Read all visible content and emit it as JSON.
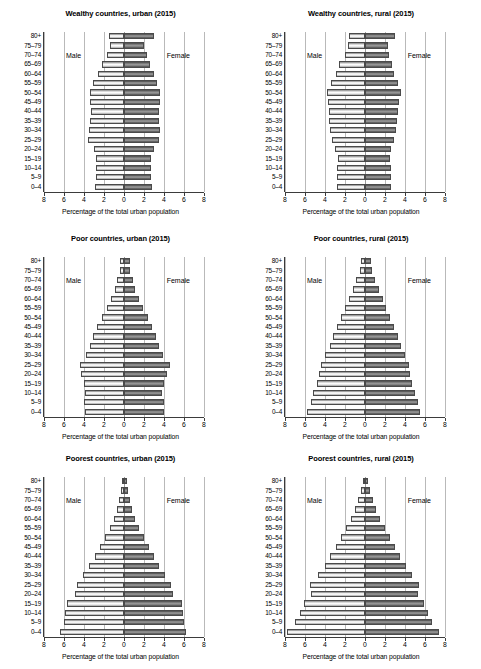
{
  "figure": {
    "age_groups": [
      "80+",
      "75–79",
      "70–74",
      "65–69",
      "60–64",
      "55–59",
      "50–54",
      "45–49",
      "40–44",
      "35–39",
      "30–34",
      "25–29",
      "20–24",
      "15–19",
      "10–14",
      "5–9",
      "0–4"
    ],
    "x_ticks": [
      "8",
      "6",
      "4",
      "2",
      "0",
      "2",
      "4",
      "6",
      "8"
    ],
    "x_axis_title": "Percentage of the total urban population",
    "male_label": "Male",
    "female_label": "Female",
    "male_color": "#f0f0f0",
    "female_color": "#7a7a7a",
    "axis_color": "#3b3b3b",
    "grid_color": "#b9b9b9",
    "xlim": [
      -8,
      8
    ]
  },
  "chart_data": [
    {
      "type": "bar",
      "title": "Wealthy countries, urban (2015)",
      "xlabel": "Percentage of the total urban population",
      "ylabel": "",
      "xlim": [
        -8,
        8
      ],
      "grid": true,
      "legend": [
        "Male",
        "Female"
      ],
      "annotations": [
        "Male",
        "Female"
      ],
      "categories": [
        "80+",
        "75–79",
        "70–74",
        "65–69",
        "60–64",
        "55–59",
        "50–54",
        "45–49",
        "40–44",
        "35–39",
        "30–34",
        "25–29",
        "20–24",
        "15–19",
        "10–14",
        "5–9",
        "0–4"
      ],
      "series": [
        {
          "name": "Male",
          "values": [
            1.55,
            1.45,
            1.75,
            2.2,
            2.65,
            3.1,
            3.45,
            3.45,
            3.35,
            3.4,
            3.55,
            3.6,
            3.05,
            2.85,
            2.85,
            2.8,
            2.95
          ]
        },
        {
          "name": "Female",
          "values": [
            3.0,
            1.95,
            2.25,
            2.6,
            2.95,
            3.3,
            3.6,
            3.55,
            3.45,
            3.45,
            3.55,
            3.5,
            2.95,
            2.7,
            2.7,
            2.7,
            2.8
          ]
        }
      ]
    },
    {
      "type": "bar",
      "title": "Wealthy countries, rural (2015)",
      "xlabel": "Percentage of the total urban population",
      "ylabel": "",
      "xlim": [
        -8,
        8
      ],
      "grid": true,
      "legend": [
        "Male",
        "Female"
      ],
      "annotations": [
        "Male",
        "Female"
      ],
      "categories": [
        "80+",
        "75–79",
        "70–74",
        "65–69",
        "60–64",
        "55–59",
        "50–54",
        "45–49",
        "40–44",
        "35–39",
        "30–34",
        "25–29",
        "20–24",
        "15–19",
        "10–14",
        "5–9",
        "0–4"
      ],
      "series": [
        {
          "name": "Male",
          "values": [
            1.6,
            1.7,
            2.05,
            2.6,
            2.95,
            3.4,
            3.85,
            3.75,
            3.65,
            3.6,
            3.5,
            3.3,
            3.0,
            2.75,
            2.85,
            2.85,
            2.8
          ]
        },
        {
          "name": "Female",
          "values": [
            2.95,
            2.3,
            2.35,
            2.65,
            2.9,
            3.25,
            3.55,
            3.4,
            3.3,
            3.2,
            3.1,
            2.9,
            2.6,
            2.45,
            2.6,
            2.6,
            2.55
          ]
        }
      ]
    },
    {
      "type": "bar",
      "title": "Poor countries, urban (2015)",
      "xlabel": "Percentage of the total urban population",
      "ylabel": "",
      "xlim": [
        -8,
        8
      ],
      "grid": true,
      "legend": [
        "Male",
        "Female"
      ],
      "annotations": [
        "Male",
        "Female"
      ],
      "categories": [
        "80+",
        "75–79",
        "70–74",
        "65–69",
        "60–64",
        "55–59",
        "50–54",
        "45–49",
        "40–44",
        "35–39",
        "30–34",
        "25–29",
        "20–24",
        "15–19",
        "10–14",
        "5–9",
        "0–4"
      ],
      "series": [
        {
          "name": "Male",
          "values": [
            0.4,
            0.45,
            0.7,
            0.95,
            1.3,
            1.7,
            2.2,
            2.7,
            3.1,
            3.4,
            3.8,
            4.45,
            4.35,
            4.0,
            3.9,
            4.0,
            3.95
          ]
        },
        {
          "name": "Female",
          "values": [
            0.55,
            0.6,
            0.85,
            1.1,
            1.45,
            1.85,
            2.35,
            2.8,
            3.2,
            3.5,
            3.9,
            4.55,
            4.25,
            3.95,
            3.8,
            3.95,
            3.95
          ]
        }
      ]
    },
    {
      "type": "bar",
      "title": "Poor countries, rural (2015)",
      "xlabel": "Percentage of the total urban population",
      "ylabel": "",
      "xlim": [
        -8,
        8
      ],
      "grid": true,
      "legend": [
        "Male",
        "Female"
      ],
      "annotations": [
        "Male",
        "Female"
      ],
      "categories": [
        "80+",
        "75–79",
        "70–74",
        "65–69",
        "60–64",
        "55–59",
        "50–54",
        "45–49",
        "40–44",
        "35–39",
        "30–34",
        "25–29",
        "20–24",
        "15–19",
        "10–14",
        "5–9",
        "0–4"
      ],
      "series": [
        {
          "name": "Male",
          "values": [
            0.45,
            0.55,
            0.9,
            1.25,
            1.65,
            2.05,
            2.45,
            2.85,
            3.2,
            3.55,
            4.0,
            4.45,
            4.6,
            4.85,
            5.25,
            5.45,
            5.8
          ]
        },
        {
          "name": "Female",
          "values": [
            0.6,
            0.7,
            1.0,
            1.35,
            1.75,
            2.1,
            2.5,
            2.9,
            3.25,
            3.55,
            3.95,
            4.35,
            4.45,
            4.65,
            5.0,
            5.25,
            5.45
          ]
        }
      ]
    },
    {
      "type": "bar",
      "title": "Poorest countries, urban (2015)",
      "xlabel": "Percentage of the total urban population",
      "ylabel": "",
      "xlim": [
        -8,
        8
      ],
      "grid": true,
      "legend": [
        "Male",
        "Female"
      ],
      "annotations": [
        "Male",
        "Female"
      ],
      "categories": [
        "80+",
        "75–79",
        "70–74",
        "65–69",
        "60–64",
        "55–59",
        "50–54",
        "45–49",
        "40–44",
        "35–39",
        "30–34",
        "25–29",
        "20–24",
        "15–19",
        "10–14",
        "5–9",
        "0–4"
      ],
      "series": [
        {
          "name": "Male",
          "values": [
            0.2,
            0.3,
            0.5,
            0.75,
            1.05,
            1.45,
            1.95,
            2.45,
            2.95,
            3.5,
            4.1,
            4.7,
            4.95,
            5.7,
            5.95,
            6.05,
            6.45
          ]
        },
        {
          "name": "Female",
          "values": [
            0.25,
            0.35,
            0.55,
            0.8,
            1.1,
            1.5,
            2.0,
            2.5,
            2.95,
            3.45,
            4.1,
            4.7,
            4.85,
            5.75,
            5.9,
            5.95,
            6.2
          ]
        }
      ]
    },
    {
      "type": "bar",
      "title": "Poorest countries, rural (2015)",
      "xlabel": "Percentage of the total urban population",
      "ylabel": "",
      "xlim": [
        -8,
        8
      ],
      "grid": true,
      "legend": [
        "Male",
        "Female"
      ],
      "annotations": [
        "Male",
        "Female"
      ],
      "categories": [
        "80+",
        "75–79",
        "70–74",
        "65–69",
        "60–64",
        "55–59",
        "50–54",
        "45–49",
        "40–44",
        "35–39",
        "30–34",
        "25–29",
        "20–24",
        "15–19",
        "10–14",
        "5–9",
        "0–4"
      ],
      "series": [
        {
          "name": "Male",
          "values": [
            0.25,
            0.45,
            0.75,
            1.05,
            1.45,
            1.9,
            2.45,
            2.95,
            3.5,
            4.05,
            4.7,
            5.55,
            5.45,
            6.1,
            6.5,
            7.0,
            7.85
          ]
        },
        {
          "name": "Female",
          "values": [
            0.3,
            0.5,
            0.8,
            1.1,
            1.5,
            1.95,
            2.5,
            3.0,
            3.5,
            4.05,
            4.65,
            5.35,
            5.25,
            5.9,
            6.3,
            6.7,
            7.4
          ]
        }
      ]
    }
  ]
}
